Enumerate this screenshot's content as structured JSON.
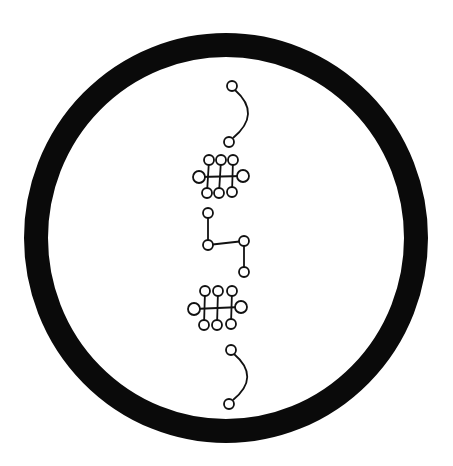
{
  "diagram": {
    "title": "",
    "background": "#ffffff",
    "ink_color": "#111111",
    "ring": {
      "cx": 226,
      "cy": 238,
      "rx": 190,
      "ry": 193,
      "stroke_width": 24,
      "color": "#0a0a0a"
    },
    "node_radius": 5,
    "line_width": 1.8,
    "components": [
      {
        "name": "top-arc",
        "type": "arc",
        "nodes": [
          [
            232,
            86
          ],
          [
            229,
            142
          ]
        ],
        "path": "M235,90 Q262,114 233,138"
      },
      {
        "name": "ladder-1",
        "type": "ladder",
        "nodes": [
          [
            199,
            177
          ],
          [
            243,
            176
          ],
          [
            209,
            160
          ],
          [
            221,
            160
          ],
          [
            233,
            160
          ],
          [
            207,
            193
          ],
          [
            219,
            193
          ],
          [
            232,
            192
          ]
        ],
        "edges": [
          [
            0,
            1
          ],
          [
            2,
            5
          ],
          [
            3,
            6
          ],
          [
            4,
            7
          ]
        ]
      },
      {
        "name": "zigzag",
        "type": "chain",
        "nodes": [
          [
            208,
            213
          ],
          [
            208,
            245
          ],
          [
            244,
            241
          ],
          [
            244,
            272
          ]
        ],
        "edges": [
          [
            0,
            1
          ],
          [
            1,
            2
          ],
          [
            2,
            3
          ]
        ]
      },
      {
        "name": "ladder-2",
        "type": "ladder",
        "nodes": [
          [
            194,
            309
          ],
          [
            241,
            307
          ],
          [
            205,
            291
          ],
          [
            218,
            291
          ],
          [
            232,
            291
          ],
          [
            204,
            325
          ],
          [
            217,
            325
          ],
          [
            231,
            324
          ]
        ],
        "edges": [
          [
            0,
            1
          ],
          [
            2,
            5
          ],
          [
            3,
            6
          ],
          [
            4,
            7
          ]
        ]
      },
      {
        "name": "bottom-arc",
        "type": "arc",
        "nodes": [
          [
            231,
            350
          ],
          [
            229,
            404
          ]
        ],
        "path": "M234,354 Q261,377 233,400"
      }
    ]
  }
}
